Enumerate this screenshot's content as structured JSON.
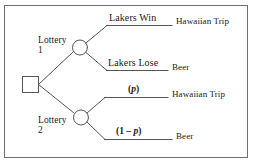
{
  "figure": {
    "type": "decision-tree",
    "border_color": "#6e6e6e",
    "line_color": "#555555",
    "text_color": "#1a1a1a"
  },
  "nodes": {
    "decision": {
      "shape": "square",
      "name": "decision-node"
    },
    "chance_upper": {
      "shape": "circle",
      "label_line1": "Lottery",
      "label_line2": "1"
    },
    "chance_lower": {
      "shape": "circle",
      "label_line1": "Lottery",
      "label_line2": "2"
    }
  },
  "branches": [
    {
      "id": "lakers-win",
      "label": "Lakers Win",
      "outcome": "Hawaiian Trip"
    },
    {
      "id": "lakers-lose",
      "label": "Lakers Lose",
      "outcome": "Beer"
    },
    {
      "id": "prob-p",
      "label_open": "(",
      "label_var": "p",
      "label_close": ")",
      "outcome": "Hawaiian Trip"
    },
    {
      "id": "prob-one-minus-p",
      "label_open": "(1 – ",
      "label_var": "p",
      "label_close": ")",
      "outcome": "Beer"
    }
  ]
}
